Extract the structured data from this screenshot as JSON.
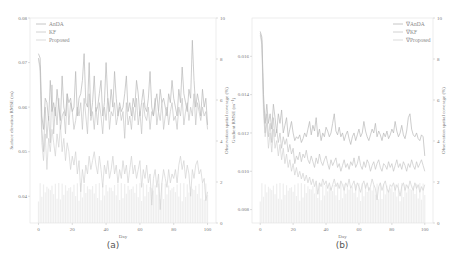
{
  "chart_data": [
    {
      "type": "line",
      "panel_label": "(a)",
      "xlabel": "Day",
      "ylabel": "Surface elevation RMSE (m)",
      "ylabel_right": "Observation spatial coverage (%)",
      "xlim": [
        -5,
        105
      ],
      "ylim": [
        0.034,
        0.08
      ],
      "ylim_right": [
        0,
        10
      ],
      "xticks": [
        0,
        20,
        40,
        60,
        80,
        100
      ],
      "yticks": [
        0.04,
        0.05,
        0.06,
        0.07,
        0.08
      ],
      "ytick_labels": [
        "0.04",
        "0.05",
        "0.06",
        "0.07",
        "0.08"
      ],
      "yticks_right": [
        0,
        2,
        4,
        6,
        8,
        10
      ],
      "legend": [
        "AnDA",
        "KF",
        "Proposed"
      ],
      "legend_position": "upper left",
      "series": [
        {
          "name": "AnDA",
          "color": "#b8b8b8",
          "values": [
            0.072,
            0.071,
            0.058,
            0.055,
            0.062,
            0.061,
            0.057,
            0.066,
            0.059,
            0.061,
            0.058,
            0.064,
            0.06,
            0.057,
            0.067,
            0.06,
            0.058,
            0.063,
            0.061,
            0.062,
            0.059,
            0.06,
            0.068,
            0.058,
            0.062,
            0.063,
            0.066,
            0.072,
            0.061,
            0.06,
            0.07,
            0.058,
            0.061,
            0.067,
            0.059,
            0.06,
            0.063,
            0.066,
            0.058,
            0.061,
            0.07,
            0.062,
            0.059,
            0.064,
            0.06,
            0.068,
            0.062,
            0.058,
            0.061,
            0.059,
            0.06,
            0.063,
            0.067,
            0.059,
            0.061,
            0.058,
            0.062,
            0.06,
            0.066,
            0.063,
            0.058,
            0.061,
            0.064,
            0.06,
            0.059,
            0.062,
            0.068,
            0.06,
            0.058,
            0.061,
            0.063,
            0.059,
            0.064,
            0.061,
            0.062,
            0.06,
            0.058,
            0.063,
            0.061,
            0.066,
            0.062,
            0.06,
            0.058,
            0.064,
            0.061,
            0.069,
            0.063,
            0.061,
            0.059,
            0.064,
            0.062,
            0.075,
            0.066,
            0.06,
            0.063,
            0.061,
            0.058,
            0.064,
            0.06,
            0.062,
            0.056
          ]
        },
        {
          "name": "KF",
          "color": "#c6c6c6",
          "values": [
            0.071,
            0.069,
            0.055,
            0.05,
            0.06,
            0.053,
            0.058,
            0.052,
            0.065,
            0.054,
            0.06,
            0.056,
            0.062,
            0.055,
            0.058,
            0.059,
            0.054,
            0.063,
            0.056,
            0.061,
            0.059,
            0.055,
            0.057,
            0.06,
            0.058,
            0.061,
            0.055,
            0.062,
            0.058,
            0.054,
            0.063,
            0.057,
            0.059,
            0.055,
            0.06,
            0.056,
            0.061,
            0.058,
            0.054,
            0.06,
            0.057,
            0.062,
            0.055,
            0.059,
            0.058,
            0.061,
            0.056,
            0.058,
            0.06,
            0.057,
            0.059,
            0.053,
            0.061,
            0.056,
            0.058,
            0.055,
            0.06,
            0.057,
            0.062,
            0.056,
            0.059,
            0.054,
            0.061,
            0.058,
            0.057,
            0.06,
            0.055,
            0.059,
            0.058,
            0.062,
            0.056,
            0.059,
            0.057,
            0.061,
            0.055,
            0.058,
            0.06,
            0.056,
            0.059,
            0.061,
            0.057,
            0.058,
            0.055,
            0.06,
            0.058,
            0.062,
            0.056,
            0.059,
            0.061,
            0.057,
            0.06,
            0.058,
            0.063,
            0.056,
            0.061,
            0.059,
            0.057,
            0.06,
            0.058,
            0.059,
            0.055
          ]
        },
        {
          "name": "Proposed",
          "color": "#d2d2d2",
          "values": [
            0.071,
            0.068,
            0.052,
            0.048,
            0.054,
            0.046,
            0.053,
            0.05,
            0.055,
            0.052,
            0.049,
            0.054,
            0.051,
            0.056,
            0.05,
            0.053,
            0.048,
            0.052,
            0.05,
            0.046,
            0.049,
            0.047,
            0.05,
            0.045,
            0.048,
            0.041,
            0.046,
            0.043,
            0.047,
            0.045,
            0.049,
            0.046,
            0.048,
            0.05,
            0.047,
            0.045,
            0.049,
            0.046,
            0.042,
            0.047,
            0.045,
            0.048,
            0.044,
            0.046,
            0.049,
            0.045,
            0.047,
            0.043,
            0.046,
            0.044,
            0.048,
            0.045,
            0.047,
            0.043,
            0.046,
            0.049,
            0.045,
            0.047,
            0.044,
            0.046,
            0.048,
            0.042,
            0.046,
            0.044,
            0.047,
            0.043,
            0.045,
            0.038,
            0.044,
            0.046,
            0.042,
            0.045,
            0.037,
            0.043,
            0.046,
            0.044,
            0.042,
            0.046,
            0.043,
            0.045,
            0.044,
            0.046,
            0.043,
            0.047,
            0.049,
            0.046,
            0.048,
            0.044,
            0.047,
            0.045,
            0.04,
            0.046,
            0.044,
            0.047,
            0.048,
            0.045,
            0.046,
            0.043,
            0.044,
            0.039,
            0.041
          ]
        }
      ],
      "bars": {
        "name": "Observation spatial coverage",
        "color": "#eeeeee",
        "typical_value": 1.5
      },
      "grid": false
    },
    {
      "type": "line",
      "panel_label": "(b)",
      "xlabel": "Day",
      "ylabel": "Gradient RMSE (m⁻¹)",
      "ylabel_right": "Observation spatial coverage (%)",
      "xlim": [
        -5,
        105
      ],
      "ylim": [
        0.0073,
        0.018
      ],
      "ylim_right": [
        0,
        10
      ],
      "xticks": [
        0,
        20,
        40,
        60,
        80,
        100
      ],
      "yticks": [
        0.008,
        0.01,
        0.012,
        0.014,
        0.016
      ],
      "ytick_labels": [
        "0.008",
        "0.010",
        "0.012",
        "0.014",
        "0.016"
      ],
      "yticks_right": [
        0,
        2,
        4,
        6,
        8,
        10
      ],
      "legend": [
        "∇AnDA",
        "∇KF",
        "∇Proposed"
      ],
      "legend_position": "upper right",
      "series": [
        {
          "name": "∇AnDA",
          "color": "#b8b8b8",
          "values": [
            0.0173,
            0.017,
            0.014,
            0.0125,
            0.0135,
            0.0125,
            0.013,
            0.0122,
            0.0135,
            0.0128,
            0.012,
            0.013,
            0.0125,
            0.0132,
            0.012,
            0.0124,
            0.0128,
            0.0118,
            0.0122,
            0.0126,
            0.012,
            0.0116,
            0.0118,
            0.0117,
            0.0119,
            0.0115,
            0.0117,
            0.012,
            0.0118,
            0.0122,
            0.0126,
            0.0119,
            0.0124,
            0.0121,
            0.0128,
            0.0118,
            0.0122,
            0.0116,
            0.012,
            0.0118,
            0.0123,
            0.0121,
            0.0118,
            0.012,
            0.0125,
            0.013,
            0.0121,
            0.0119,
            0.0123,
            0.0118,
            0.012,
            0.0116,
            0.0119,
            0.0121,
            0.0117,
            0.0114,
            0.0118,
            0.012,
            0.0116,
            0.0119,
            0.0122,
            0.0118,
            0.012,
            0.0126,
            0.0121,
            0.0118,
            0.0116,
            0.0119,
            0.0122,
            0.012,
            0.0125,
            0.0118,
            0.0121,
            0.0119,
            0.0116,
            0.012,
            0.0118,
            0.0121,
            0.0117,
            0.0119,
            0.0122,
            0.012,
            0.0126,
            0.0121,
            0.0118,
            0.012,
            0.0124,
            0.0119,
            0.0117,
            0.0121,
            0.0128,
            0.013,
            0.0122,
            0.0119,
            0.0118,
            0.012,
            0.0117,
            0.0116,
            0.0119,
            0.0118,
            0.0108
          ]
        },
        {
          "name": "∇KF",
          "color": "#c6c6c6",
          "values": [
            0.0172,
            0.0168,
            0.0135,
            0.012,
            0.013,
            0.0118,
            0.0125,
            0.0115,
            0.0128,
            0.0118,
            0.0122,
            0.0115,
            0.012,
            0.0112,
            0.0118,
            0.0114,
            0.0117,
            0.011,
            0.0114,
            0.0109,
            0.0112,
            0.0104,
            0.0108,
            0.0106,
            0.011,
            0.0105,
            0.0109,
            0.0107,
            0.0111,
            0.0106,
            0.0104,
            0.0108,
            0.0105,
            0.0102,
            0.0107,
            0.0104,
            0.0109,
            0.0105,
            0.0103,
            0.0106,
            0.0108,
            0.0104,
            0.0101,
            0.0106,
            0.0103,
            0.0105,
            0.0107,
            0.0102,
            0.0104,
            0.01,
            0.0103,
            0.0106,
            0.0102,
            0.0104,
            0.0101,
            0.0105,
            0.0103,
            0.0107,
            0.0102,
            0.0104,
            0.0108,
            0.0103,
            0.0101,
            0.0105,
            0.0102,
            0.0106,
            0.0104,
            0.01,
            0.0103,
            0.0105,
            0.0101,
            0.0104,
            0.0106,
            0.0102,
            0.01,
            0.0104,
            0.0103,
            0.0101,
            0.0105,
            0.0102,
            0.0104,
            0.01,
            0.0103,
            0.0106,
            0.0102,
            0.0104,
            0.0101,
            0.0105,
            0.0103,
            0.01,
            0.0104,
            0.0102,
            0.0106,
            0.0103,
            0.0101,
            0.0105,
            0.0102,
            0.0104,
            0.0106,
            0.0103,
            0.01
          ]
        },
        {
          "name": "∇Proposed",
          "color": "#d2d2d2",
          "values": [
            0.0171,
            0.0166,
            0.013,
            0.0118,
            0.0125,
            0.0112,
            0.012,
            0.011,
            0.0122,
            0.0112,
            0.0116,
            0.0108,
            0.0114,
            0.0106,
            0.0112,
            0.0104,
            0.0109,
            0.0102,
            0.0106,
            0.01,
            0.0104,
            0.0098,
            0.0102,
            0.0097,
            0.01,
            0.0096,
            0.0099,
            0.0095,
            0.0098,
            0.0094,
            0.0097,
            0.0093,
            0.0096,
            0.0092,
            0.0095,
            0.0088,
            0.0094,
            0.0092,
            0.0096,
            0.0093,
            0.0095,
            0.0091,
            0.0094,
            0.009,
            0.0093,
            0.0096,
            0.0092,
            0.0094,
            0.0091,
            0.0095,
            0.0093,
            0.009,
            0.0094,
            0.0092,
            0.0096,
            0.0091,
            0.0093,
            0.0095,
            0.009,
            0.0094,
            0.0092,
            0.0089,
            0.0093,
            0.0095,
            0.0091,
            0.0094,
            0.009,
            0.0092,
            0.0096,
            0.0093,
            0.0091,
            0.0085,
            0.0092,
            0.0094,
            0.009,
            0.0093,
            0.0095,
            0.0091,
            0.0089,
            0.0093,
            0.0092,
            0.0094,
            0.009,
            0.0093,
            0.0091,
            0.0087,
            0.0092,
            0.0094,
            0.009,
            0.0093,
            0.0091,
            0.0095,
            0.0092,
            0.009,
            0.0094,
            0.0091,
            0.0093,
            0.0089,
            0.0092,
            0.009,
            0.0093
          ]
        }
      ],
      "bars": {
        "name": "Observation spatial coverage",
        "color": "#eeeeee",
        "typical_value": 1.5
      },
      "grid": false
    }
  ],
  "panels": [
    {
      "caption": "(a)",
      "legend": [
        "AnDA",
        "KF",
        "Proposed"
      ],
      "xlabel": "Day",
      "ylabel": "Surface elevation RMSE (m)",
      "ylabel_right": "Observation spatial coverage (%)"
    },
    {
      "caption": "(b)",
      "legend": [
        "∇AnDA",
        "∇KF",
        "∇Proposed"
      ],
      "xlabel": "Day",
      "ylabel": "Gradient RMSE (m⁻¹)",
      "ylabel_right": "Observation spatial coverage (%)"
    }
  ]
}
